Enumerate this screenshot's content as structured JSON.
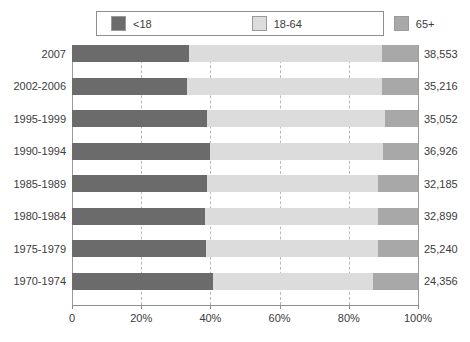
{
  "chart_data": {
    "type": "bar",
    "orientation": "horizontal",
    "stacked": true,
    "normalized": true,
    "title": "",
    "subtitle": "",
    "xlabel": "",
    "ylabel": "",
    "xlim": [
      0,
      100
    ],
    "grid": true,
    "legend_position": "top",
    "xticks": [
      {
        "value": 0,
        "label": "0"
      },
      {
        "value": 20,
        "label": "20%"
      },
      {
        "value": 40,
        "label": "40%"
      },
      {
        "value": 60,
        "label": "60%"
      },
      {
        "value": 80,
        "label": "80%"
      },
      {
        "value": 100,
        "label": "100%"
      }
    ],
    "categories": [
      "2007",
      "2002-2006",
      "1995-1999",
      "1990-1994",
      "1985-1989",
      "1980-1984",
      "1975-1979",
      "1970-1974"
    ],
    "series": [
      {
        "name": "<18",
        "color": "#6b6b6b",
        "values": [
          33.8,
          33.2,
          39.0,
          39.9,
          39.0,
          38.4,
          38.7,
          40.7
        ]
      },
      {
        "name": "18-64",
        "color": "#dcdcdc",
        "values": [
          55.8,
          56.4,
          51.5,
          50.0,
          49.5,
          50.1,
          49.8,
          46.3
        ]
      },
      {
        "name": "65+",
        "color": "#a8a8a8",
        "values": [
          10.4,
          10.4,
          9.5,
          10.1,
          11.5,
          11.5,
          11.5,
          13.0
        ]
      }
    ],
    "value_labels": [
      "38,553",
      "35,216",
      "35,052",
      "36,926",
      "32,185",
      "32,899",
      "25,240",
      "24,356"
    ]
  }
}
